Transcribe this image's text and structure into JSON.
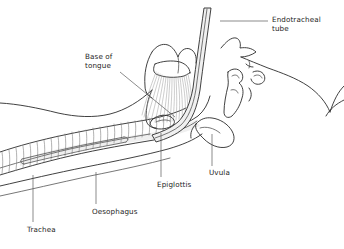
{
  "figure": {
    "background_color": "#ffffff",
    "line_color": "#2b2b2b",
    "hatch_color": "#9a9a9a",
    "text_color": "#1d1d1d",
    "width": 344,
    "height": 249
  },
  "labels": {
    "endotracheal_tube": "Endotracheal\ntube",
    "base_of_tongue": "Base of\ntongue",
    "epiglottis": "Epiglottis",
    "uvula": "Uvula",
    "oesophagus": "Oesophagus",
    "trachea": "Trachea"
  },
  "structures": [
    {
      "name": "endotracheal-tube",
      "label": "Endotracheal tube"
    },
    {
      "name": "base-of-tongue",
      "label": "Base of tongue"
    },
    {
      "name": "epiglottis",
      "label": "Epiglottis"
    },
    {
      "name": "uvula",
      "label": "Uvula"
    },
    {
      "name": "oesophagus",
      "label": "Oesophagus"
    },
    {
      "name": "trachea",
      "label": "Trachea"
    },
    {
      "name": "facial-profile",
      "label": "Facial profile"
    },
    {
      "name": "hard-palate",
      "label": "Hard palate"
    },
    {
      "name": "hyoid-bone",
      "label": "Hyoid bone"
    },
    {
      "name": "neck-contour",
      "label": "Neck contour"
    }
  ]
}
